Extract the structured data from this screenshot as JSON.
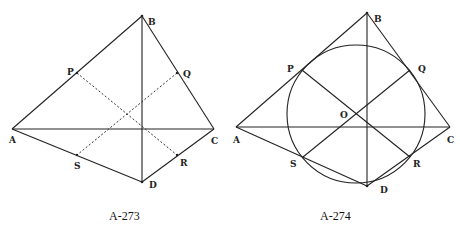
{
  "figures": [
    {
      "id": "fig1",
      "caption": "A-273",
      "points": {
        "A": {
          "label": "A",
          "x": 12,
          "y": 129
        },
        "B": {
          "label": "B",
          "x": 142,
          "y": 16
        },
        "C": {
          "label": "C",
          "x": 214,
          "y": 129
        },
        "D": {
          "label": "D",
          "x": 142,
          "y": 182
        },
        "P": {
          "label": "P",
          "x": 77,
          "y": 73
        },
        "Q": {
          "label": "Q",
          "x": 177,
          "y": 73
        },
        "R": {
          "label": "R",
          "x": 177,
          "y": 155
        },
        "S": {
          "label": "S",
          "x": 77,
          "y": 155
        }
      },
      "solid_segments": [
        [
          "A",
          "B"
        ],
        [
          "B",
          "C"
        ],
        [
          "C",
          "D"
        ],
        [
          "D",
          "A"
        ],
        [
          "A",
          "C"
        ],
        [
          "B",
          "D"
        ]
      ],
      "dashed_segments": [
        [
          "P",
          "R"
        ],
        [
          "Q",
          "S"
        ]
      ]
    },
    {
      "id": "fig2",
      "caption": "A-274",
      "points": {
        "A": {
          "label": "A",
          "x": 236,
          "y": 127
        },
        "B": {
          "label": "B",
          "x": 367,
          "y": 13
        },
        "C": {
          "label": "C",
          "x": 450,
          "y": 127
        },
        "D": {
          "label": "D",
          "x": 367,
          "y": 186
        },
        "P": {
          "label": "P",
          "x": 302,
          "y": 70
        },
        "Q": {
          "label": "Q",
          "x": 410,
          "y": 70
        },
        "R": {
          "label": "R",
          "x": 410,
          "y": 157
        },
        "S": {
          "label": "S",
          "x": 303,
          "y": 157
        },
        "O": {
          "label": "O",
          "x": 356,
          "y": 114
        }
      },
      "circle": {
        "center": "O",
        "cx": 356,
        "cy": 114,
        "r": 69
      },
      "solid_segments": [
        [
          "A",
          "B"
        ],
        [
          "B",
          "C"
        ],
        [
          "C",
          "D"
        ],
        [
          "D",
          "A"
        ],
        [
          "A",
          "C"
        ],
        [
          "B",
          "D"
        ],
        [
          "P",
          "R"
        ],
        [
          "Q",
          "S"
        ]
      ]
    }
  ]
}
